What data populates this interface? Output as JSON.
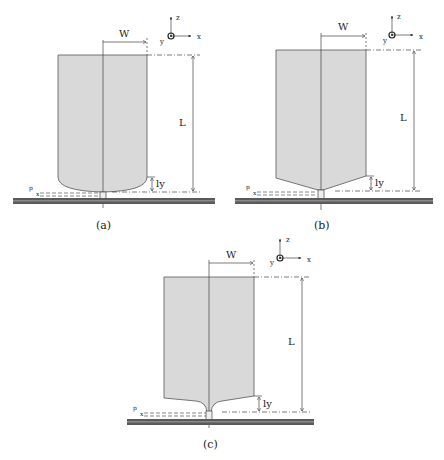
{
  "figure": {
    "colors": {
      "body_fill": "#d9d9d9",
      "outline": "#555555",
      "substrate_dark": "#5a5a5a",
      "substrate_light": "#8a8a8a"
    },
    "axes_labels": {
      "z": "z",
      "x": "x",
      "y": "y"
    },
    "dimension_labels": {
      "width": "W",
      "length": "L",
      "ly": "ly",
      "p": "p",
      "x": "x"
    },
    "panels": [
      {
        "id": "a",
        "caption": "(a)",
        "shape": "rectangle with rounded (elliptical) bottom"
      },
      {
        "id": "b",
        "caption": "(b)",
        "shape": "rectangle with V-shaped (conical) bottom"
      },
      {
        "id": "c",
        "caption": "(c)",
        "shape": "rectangle with flared concave taper bottom"
      }
    ]
  }
}
